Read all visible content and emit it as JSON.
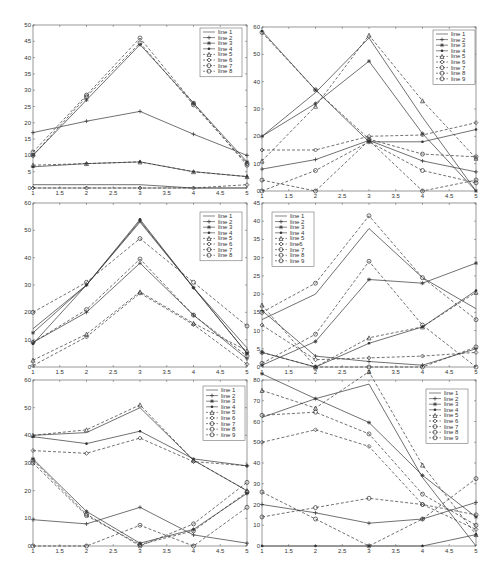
{
  "figure": {
    "layout": "3x2 subplot grid",
    "background": "#ffffff",
    "line_color": "#333333"
  },
  "chart_data": [
    {
      "type": "line",
      "title": "",
      "xlabel": "",
      "ylabel": "",
      "panel": {
        "x0": 33,
        "x1": 247,
        "y0": 25,
        "y1": 188
      },
      "x": [
        1,
        2,
        3,
        4,
        5
      ],
      "xlim": [
        1,
        5
      ],
      "ylim": [
        0,
        50
      ],
      "xticks": [
        "1",
        "1.5",
        "2",
        "2.5",
        "3",
        "3.5",
        "4",
        "4.5",
        "5"
      ],
      "yticks": [
        "0",
        "5",
        "10",
        "15",
        "20",
        "25",
        "30",
        "35",
        "40",
        "45",
        "50"
      ],
      "grid": false,
      "legend": {
        "position": "upper right",
        "x": 200,
        "y": 28
      },
      "series": [
        {
          "name": "line 1",
          "style": "solid",
          "marker": "none",
          "values": [
            1,
            1,
            1,
            0,
            0
          ]
        },
        {
          "name": "line 2",
          "style": "solid",
          "marker": "plus",
          "values": [
            17,
            20.5,
            23.5,
            16.5,
            10
          ]
        },
        {
          "name": "line 3",
          "style": "solid",
          "marker": "star",
          "values": [
            10,
            27,
            44,
            26,
            8
          ]
        },
        {
          "name": "line 4",
          "style": "solid",
          "marker": "dot",
          "values": [
            6.5,
            7.5,
            8,
            5,
            3.5
          ]
        },
        {
          "name": "line 5",
          "style": "dashed",
          "marker": "triangle",
          "values": [
            7,
            7.5,
            8,
            5,
            3.5
          ]
        },
        {
          "name": "line 6",
          "style": "dashed",
          "marker": "diamond",
          "values": [
            0,
            0,
            0,
            0,
            1
          ]
        },
        {
          "name": "line 7",
          "style": "dashed",
          "marker": "circle",
          "values": [
            11,
            28.5,
            46,
            26,
            7
          ]
        },
        {
          "name": "line 8",
          "style": "dashed",
          "marker": "circle",
          "values": [
            10,
            28,
            44.5,
            25.5,
            7.5
          ]
        }
      ]
    },
    {
      "type": "line",
      "title": "",
      "xlabel": "",
      "ylabel": "",
      "panel": {
        "x0": 262,
        "x1": 476,
        "y0": 27,
        "y1": 191
      },
      "x": [
        1,
        2,
        3,
        4,
        5
      ],
      "xlim": [
        1,
        5
      ],
      "ylim": [
        0,
        60
      ],
      "xticks": [
        "1",
        "1.5",
        "2",
        "2.5",
        "3",
        "3.5",
        "4",
        "4.5",
        "5"
      ],
      "yticks": [
        "0",
        "10",
        "20",
        "30",
        "40",
        "50",
        "60"
      ],
      "grid": false,
      "legend": {
        "position": "upper right",
        "x": 433,
        "y": 30
      },
      "series": [
        {
          "name": "line 1",
          "style": "solid",
          "marker": "none",
          "values": [
            20,
            36,
            56,
            27,
            0
          ]
        },
        {
          "name": "line 2",
          "style": "solid",
          "marker": "plus",
          "values": [
            8,
            11.5,
            18.5,
            11,
            7
          ]
        },
        {
          "name": "line 3",
          "style": "solid",
          "marker": "star",
          "values": [
            20,
            32,
            47.5,
            21,
            0
          ]
        },
        {
          "name": "line 4",
          "style": "solid",
          "marker": "dot",
          "values": [
            58.5,
            37,
            18,
            18,
            22.5
          ]
        },
        {
          "name": "line 5",
          "style": "dashed",
          "marker": "triangle",
          "values": [
            11,
            31,
            57,
            33,
            12
          ]
        },
        {
          "name": "line 6",
          "style": "dashed",
          "marker": "diamond",
          "values": [
            15,
            15,
            20,
            20.5,
            25
          ]
        },
        {
          "name": "line 7",
          "style": "dashed",
          "marker": "circle",
          "values": [
            4,
            0,
            18.5,
            0,
            4
          ]
        },
        {
          "name": "line 8",
          "style": "dashed",
          "marker": "circle",
          "values": [
            0,
            7.5,
            18,
            7.5,
            3
          ]
        },
        {
          "name": "line 9",
          "style": "dashed",
          "marker": "circle",
          "values": [
            58,
            37,
            19,
            13.5,
            12.5
          ]
        }
      ]
    },
    {
      "type": "line",
      "title": "",
      "xlabel": "",
      "ylabel": "",
      "panel": {
        "x0": 33,
        "x1": 247,
        "y0": 203,
        "y1": 367
      },
      "x": [
        1,
        2,
        3,
        4,
        5
      ],
      "xlim": [
        1,
        5
      ],
      "ylim": [
        0,
        60
      ],
      "xticks": [
        "1",
        "1.5",
        "2",
        "2.5",
        "3",
        "3.5",
        "4",
        "4.5",
        "5"
      ],
      "yticks": [
        "0",
        "10",
        "20",
        "30",
        "40",
        "50",
        "60"
      ],
      "grid": false,
      "legend": {
        "position": "upper right",
        "x": 200,
        "y": 212
      },
      "series": [
        {
          "name": "line 1",
          "style": "solid",
          "marker": "none",
          "values": [
            14,
            30,
            53,
            29,
            7
          ]
        },
        {
          "name": "line 2",
          "style": "solid",
          "marker": "plus",
          "values": [
            9,
            20,
            38,
            19,
            3
          ]
        },
        {
          "name": "line 3",
          "style": "solid",
          "marker": "star",
          "values": [
            12.5,
            30,
            53.5,
            29,
            5
          ]
        },
        {
          "name": "line 4",
          "style": "solid",
          "marker": "dot",
          "values": [
            8.5,
            30,
            54,
            29,
            5
          ]
        },
        {
          "name": "line 5",
          "style": "dashed",
          "marker": "triangle",
          "values": [
            2.5,
            12,
            27.5,
            16,
            6
          ]
        },
        {
          "name": "line 6",
          "style": "dashed",
          "marker": "diamond",
          "values": [
            0.5,
            11,
            27,
            15.5,
            1
          ]
        },
        {
          "name": "line 7",
          "style": "dashed",
          "marker": "circle",
          "values": [
            20,
            31,
            47,
            31,
            15
          ]
        },
        {
          "name": "line 8",
          "style": "dashed",
          "marker": "circle",
          "values": [
            9,
            21,
            39.5,
            19,
            4
          ]
        }
      ]
    },
    {
      "type": "line",
      "title": "",
      "xlabel": "",
      "ylabel": "",
      "panel": {
        "x0": 262,
        "x1": 476,
        "y0": 203,
        "y1": 367
      },
      "x": [
        1,
        2,
        3,
        4,
        5
      ],
      "xlim": [
        1,
        5
      ],
      "ylim": [
        0,
        45
      ],
      "xticks": [
        "1",
        "1.5",
        "2",
        "2.5",
        "3",
        "3.5",
        "4",
        "4.5",
        "5"
      ],
      "yticks": [
        "0",
        "5",
        "10",
        "15",
        "20",
        "25",
        "30",
        "35",
        "40",
        "45"
      ],
      "grid": false,
      "legend": {
        "position": "upper left",
        "x": 272,
        "y": 212
      },
      "series": [
        {
          "name": "line 1",
          "style": "solid",
          "marker": "none",
          "values": [
            13,
            20,
            38,
            24.5,
            16
          ]
        },
        {
          "name": "line 2",
          "style": "solid",
          "marker": "plus",
          "values": [
            15.5,
            3,
            1.5,
            0.5,
            5
          ]
        },
        {
          "name": "line 3",
          "style": "solid",
          "marker": "star",
          "values": [
            0.5,
            7,
            24,
            23,
            28.5
          ]
        },
        {
          "name": "line 4",
          "style": "solid",
          "marker": "dot",
          "values": [
            4,
            0,
            6.5,
            11,
            21
          ]
        },
        {
          "name": "line 5",
          "style": "dashed",
          "marker": "triangle",
          "values": [
            17,
            0,
            8,
            11,
            20.5
          ]
        },
        {
          "name": "line6",
          "style": "dashed",
          "marker": "diamond",
          "values": [
            11.5,
            2,
            2.5,
            3,
            4
          ]
        },
        {
          "name": "line 7",
          "style": "dashed",
          "marker": "circle",
          "values": [
            4,
            0,
            0,
            0,
            5.5
          ]
        },
        {
          "name": "line 8",
          "style": "dashed",
          "marker": "circle",
          "values": [
            15,
            23,
            41.5,
            24.5,
            13
          ]
        },
        {
          "name": "line 9",
          "style": "dashed",
          "marker": "circle",
          "values": [
            1,
            9,
            29,
            11.5,
            0
          ]
        }
      ]
    },
    {
      "type": "line",
      "title": "",
      "xlabel": "",
      "ylabel": "",
      "panel": {
        "x0": 33,
        "x1": 247,
        "y0": 380,
        "y1": 546
      },
      "x": [
        1,
        2,
        3,
        4,
        5
      ],
      "xlim": [
        1,
        5
      ],
      "ylim": [
        0,
        60
      ],
      "xticks": [
        "1",
        "1.5",
        "2",
        "2.5",
        "3",
        "3.5",
        "4",
        "4.5",
        "5"
      ],
      "yticks": [
        "0",
        "10",
        "20",
        "30",
        "40",
        "50",
        "60"
      ],
      "grid": false,
      "legend": {
        "position": "upper right",
        "x": 203,
        "y": 386
      },
      "series": [
        {
          "name": "line 1",
          "style": "solid",
          "marker": "none",
          "values": [
            40,
            41,
            50,
            31,
            20
          ]
        },
        {
          "name": "line 2",
          "style": "solid",
          "marker": "plus",
          "values": [
            9.5,
            8,
            14,
            4,
            1
          ]
        },
        {
          "name": "line 3",
          "style": "solid",
          "marker": "star",
          "values": [
            31.5,
            12.5,
            1,
            6,
            19
          ]
        },
        {
          "name": "line 4",
          "style": "solid",
          "marker": "dot",
          "values": [
            39.5,
            37,
            41.5,
            31.5,
            29
          ]
        },
        {
          "name": "line 5",
          "style": "dashed",
          "marker": "triangle",
          "values": [
            40,
            42,
            51,
            31,
            20
          ]
        },
        {
          "name": "line 6",
          "style": "dashed",
          "marker": "diamond",
          "values": [
            34.5,
            33.5,
            39,
            30.5,
            29
          ]
        },
        {
          "name": "line 7",
          "style": "dashed",
          "marker": "circle",
          "values": [
            31,
            11.5,
            0,
            8,
            23
          ]
        },
        {
          "name": "line 8",
          "style": "dashed",
          "marker": "circle",
          "values": [
            0,
            0,
            7.5,
            0,
            14
          ]
        },
        {
          "name": "line 9",
          "style": "dashed",
          "marker": "circle",
          "values": [
            30,
            11,
            0.5,
            5.5,
            19.5
          ]
        }
      ]
    },
    {
      "type": "line",
      "title": "",
      "xlabel": "",
      "ylabel": "",
      "panel": {
        "x0": 262,
        "x1": 476,
        "y0": 380,
        "y1": 546
      },
      "x": [
        1,
        2,
        3,
        4,
        5
      ],
      "xlim": [
        1,
        5
      ],
      "ylim": [
        0,
        80
      ],
      "xticks": [
        "1",
        "1.5",
        "2",
        "2.5",
        "3",
        "3.5",
        "4",
        "4.5",
        "5"
      ],
      "yticks": [
        "0",
        "10",
        "20",
        "30",
        "40",
        "50",
        "60",
        "70",
        "80"
      ],
      "grid": false,
      "legend": {
        "position": "upper right",
        "x": 426,
        "y": 389
      },
      "series": [
        {
          "name": "line 1",
          "style": "solid",
          "marker": "none",
          "values": [
            62,
            71,
            78,
            33,
            0
          ]
        },
        {
          "name": "line 2",
          "style": "solid",
          "marker": "plus",
          "values": [
            20,
            16,
            11,
            13,
            21
          ]
        },
        {
          "name": "line 3",
          "style": "solid",
          "marker": "star",
          "values": [
            83,
            71,
            59.5,
            34,
            14
          ]
        },
        {
          "name": "line 4",
          "style": "solid",
          "marker": "dot",
          "values": [
            0,
            0,
            0,
            0,
            5.5
          ]
        },
        {
          "name": "line 5",
          "style": "dashed",
          "marker": "triangle",
          "values": [
            75,
            66.5,
            84,
            39,
            5.5
          ]
        },
        {
          "name": "line 6",
          "style": "dashed",
          "marker": "diamond",
          "values": [
            50,
            56,
            48,
            20,
            8
          ]
        },
        {
          "name": "line 7",
          "style": "dashed",
          "marker": "circle",
          "values": [
            26,
            13,
            0,
            13,
            32.5
          ]
        },
        {
          "name": "line 8",
          "style": "dashed",
          "marker": "circle",
          "values": [
            14,
            18.5,
            23,
            20,
            15
          ]
        },
        {
          "name": "line 9",
          "style": "dashed",
          "marker": "circle",
          "values": [
            63,
            64.5,
            54,
            25,
            10
          ]
        }
      ]
    }
  ]
}
